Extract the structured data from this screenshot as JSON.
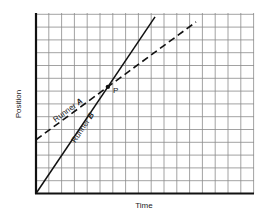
{
  "chart_data": {
    "type": "line",
    "title": "",
    "xlabel": "Time",
    "ylabel": "Position",
    "grid": true,
    "grid_cells": {
      "x": 17,
      "y": 14
    },
    "xlim": [
      0,
      17
    ],
    "ylim": [
      0,
      14
    ],
    "tick_labels": {
      "x": [],
      "y": []
    },
    "legend": null,
    "series": [
      {
        "name": "Runner A",
        "label_prefix": "Runner ",
        "label_letter": "A",
        "style": "dashed",
        "x": [
          0,
          12.5
        ],
        "y": [
          4.2,
          13.4
        ]
      },
      {
        "name": "Runner B",
        "label_prefix": "Runner ",
        "label_letter": "B",
        "style": "solid",
        "x": [
          0,
          9.3
        ],
        "y": [
          0,
          13.8
        ]
      }
    ],
    "annotations": [
      {
        "text": "P",
        "x": 5.8,
        "y": 8.6,
        "note": "intersection point of Runner A and Runner B"
      }
    ]
  }
}
